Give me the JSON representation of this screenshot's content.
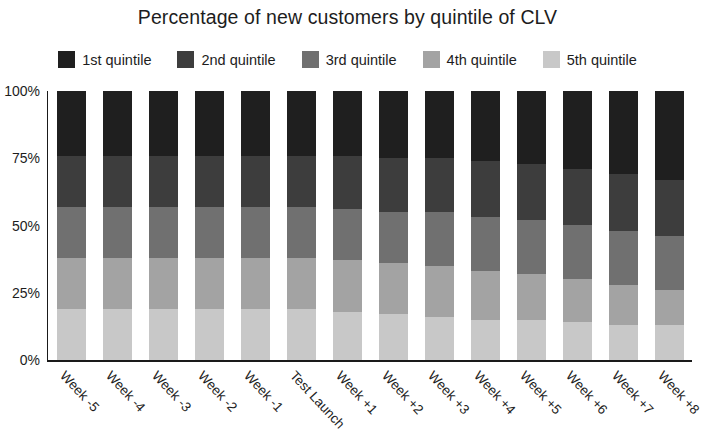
{
  "chart_data": {
    "type": "bar",
    "title": "Percentage of new customers by quintile of CLV",
    "subtitle": "",
    "xlabel": "",
    "ylabel": "",
    "stacked": true,
    "stack_normalized": true,
    "grid": false,
    "legend_position": "top",
    "ylim": [
      0,
      100
    ],
    "ytick_labels": [
      "0%",
      "25%",
      "50%",
      "75%",
      "100%"
    ],
    "ytick_values": [
      0,
      25,
      50,
      75,
      100
    ],
    "categories": [
      "Week -5",
      "Week -4",
      "Week -3",
      "Week -2",
      "Week -1",
      "Test Launch",
      "Week +1",
      "Week +2",
      "Week +3",
      "Week +4",
      "Week +5",
      "Week +6",
      "Week +7",
      "Week +8"
    ],
    "series": [
      {
        "name": "1st quintile",
        "color": "#1f1f1f",
        "values": [
          24,
          24,
          24,
          24,
          24,
          24,
          24,
          25,
          25,
          26,
          27,
          29,
          31,
          33
        ]
      },
      {
        "name": "2nd quintile",
        "color": "#3d3d3d",
        "values": [
          19,
          19,
          19,
          19,
          19,
          19,
          20,
          20,
          20,
          21,
          21,
          21,
          21,
          21
        ]
      },
      {
        "name": "3rd quintile",
        "color": "#707070",
        "values": [
          19,
          19,
          19,
          19,
          19,
          19,
          19,
          19,
          20,
          20,
          20,
          20,
          20,
          20
        ]
      },
      {
        "name": "4th quintile",
        "color": "#a3a3a3",
        "values": [
          19,
          19,
          19,
          19,
          19,
          19,
          19,
          19,
          19,
          18,
          17,
          16,
          15,
          13
        ]
      },
      {
        "name": "5th quintile",
        "color": "#c8c8c8",
        "values": [
          19,
          19,
          19,
          19,
          19,
          19,
          18,
          17,
          16,
          15,
          15,
          14,
          13,
          13
        ]
      }
    ]
  }
}
